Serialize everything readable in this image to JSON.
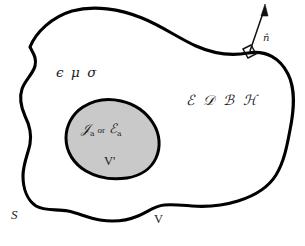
{
  "diagram": {
    "type": "electromagnetic-field-region-diagram",
    "colors": {
      "background": "#ffffff",
      "outline": "#000000",
      "inner_fill": "#c9c9c9",
      "text": "#1a1a1a"
    },
    "outer_region": {
      "name": "outer-volume",
      "medium_label": "ϵ μ σ",
      "medium_label_parts": [
        "ϵ",
        "μ",
        "σ"
      ],
      "field_label": "ℰ 𝒟 ℬ ℋ",
      "field_label_parts": [
        "ℰ",
        "𝒟",
        "ℬ",
        "ℋ"
      ],
      "volume_label": "V",
      "surface_label": "S"
    },
    "inner_region": {
      "name": "source-volume",
      "source_label_current": "𝒥",
      "source_label_current_sub": "a",
      "conjunction": "or",
      "source_label_field": "ℰ",
      "source_label_field_sub": "a",
      "volume_label": "V'"
    },
    "normal_vector": {
      "label": "n̂",
      "description": "outward unit normal on surface S",
      "right_angle_marker": true
    }
  }
}
